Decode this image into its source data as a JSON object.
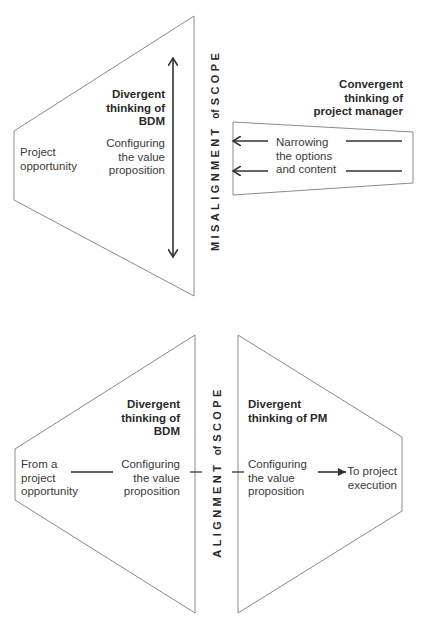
{
  "top": {
    "bdm_trapezoid": {
      "start_label": [
        "Project",
        "opportunity"
      ],
      "heading": [
        "Divergent",
        "thinking of",
        "BDM"
      ],
      "content": [
        "Configuring",
        "the value",
        "proposition"
      ]
    },
    "divider_label": {
      "prefix": "MISALIGNMENT",
      "of": "of",
      "suffix": "SCOPE"
    },
    "pm_trapezoid": {
      "heading": [
        "Convergent",
        "thinking of",
        "project manager"
      ],
      "content": [
        "Narrowing",
        "the options",
        "and content"
      ]
    }
  },
  "bottom": {
    "bdm_trapezoid": {
      "start_label": [
        "From a",
        "project",
        "opportunity"
      ],
      "heading": [
        "Divergent",
        "thinking of",
        "BDM"
      ],
      "content": [
        "Configuring",
        "the value",
        "proposition"
      ]
    },
    "divider_label": {
      "prefix": "ALIGNMENT",
      "of": "of",
      "suffix": "SCOPE"
    },
    "pm_trapezoid": {
      "heading": [
        "Divergent",
        "thinking of PM"
      ],
      "content": [
        "Configuring",
        "the value",
        "proposition"
      ],
      "end_label": [
        "To project",
        "execution"
      ]
    }
  },
  "colors": {
    "outline": "#8a8a8a",
    "arrow": "#333333",
    "text": "#3a3a3a"
  }
}
